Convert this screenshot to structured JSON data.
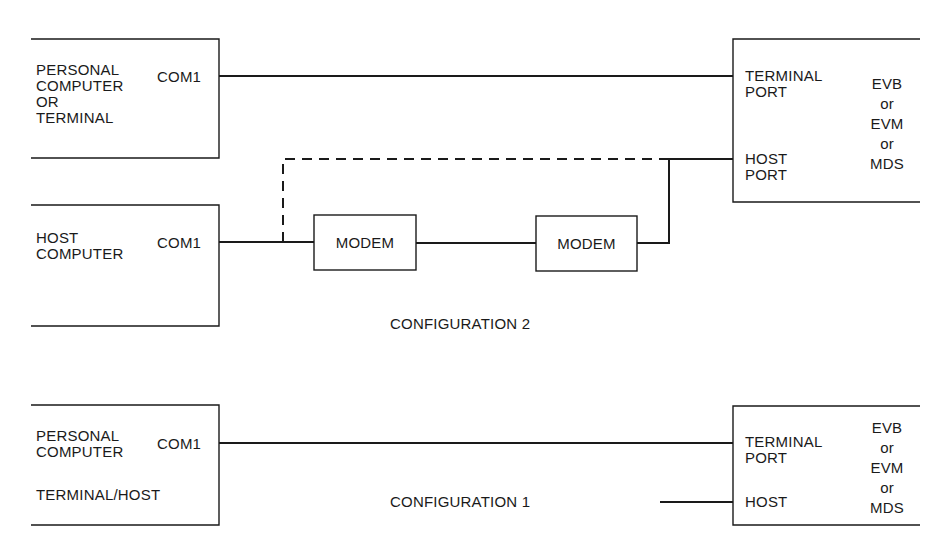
{
  "configuration_2": {
    "caption": "CONFIGURATION 2",
    "pc_box": {
      "lines": [
        "PERSONAL",
        "COMPUTER",
        "OR",
        "TERMINAL"
      ],
      "port": "COM1"
    },
    "host_box": {
      "lines": [
        "HOST",
        "COMPUTER"
      ],
      "port": "COM1"
    },
    "modem_1": "MODEM",
    "modem_2": "MODEM",
    "target_box": {
      "terminal_port": [
        "TERMINAL",
        "PORT"
      ],
      "host_port": [
        "HOST",
        "PORT"
      ],
      "device": [
        "EVB",
        "or",
        "EVM",
        "or",
        "MDS"
      ]
    },
    "dashed_link_note": "direct host connection (optional)"
  },
  "configuration_1": {
    "caption": "CONFIGURATION 1",
    "pc_box": {
      "lines": [
        "PERSONAL",
        "COMPUTER"
      ],
      "port": "COM1",
      "role": "TERMINAL/HOST"
    },
    "target_box": {
      "terminal_port": [
        "TERMINAL",
        "PORT"
      ],
      "host_port": "HOST",
      "device": [
        "EVB",
        "or",
        "EVM",
        "or",
        "MDS"
      ]
    }
  },
  "colors": {
    "line": "#1a1a1a",
    "background": "#ffffff"
  }
}
